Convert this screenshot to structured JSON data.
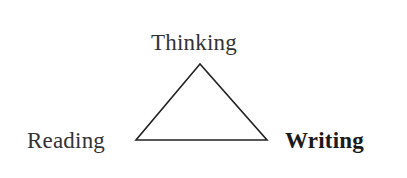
{
  "diagram": {
    "type": "triangle",
    "nodes": [
      {
        "id": "top",
        "label": "Thinking",
        "bold": false
      },
      {
        "id": "left",
        "label": "Reading",
        "bold": false
      },
      {
        "id": "right",
        "label": "Writing",
        "bold": true
      }
    ],
    "edges": [
      {
        "from": "top",
        "to": "left"
      },
      {
        "from": "left",
        "to": "right"
      },
      {
        "from": "right",
        "to": "top"
      }
    ],
    "line_color": "#222222"
  }
}
